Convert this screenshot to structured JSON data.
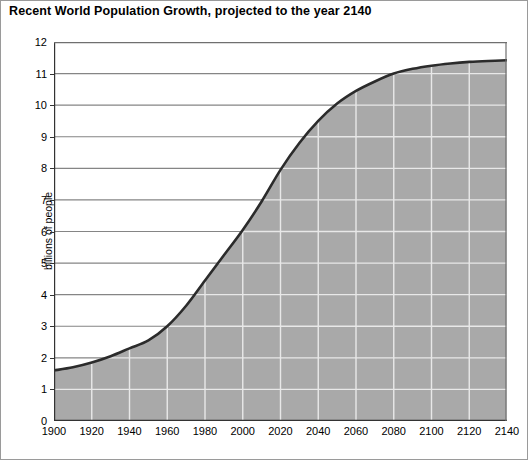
{
  "chart_data": {
    "type": "area",
    "title": "Recent World Population Growth, projected to the year 2140",
    "xlabel": "",
    "ylabel": "billions of people",
    "xlim": [
      1900,
      2140
    ],
    "ylim": [
      0,
      12
    ],
    "grid": true,
    "legend": "none",
    "xticks": [
      1900,
      1920,
      1940,
      1960,
      1980,
      2000,
      2020,
      2040,
      2060,
      2080,
      2100,
      2120,
      2140
    ],
    "yticks": [
      0,
      1,
      2,
      3,
      4,
      5,
      6,
      7,
      8,
      9,
      10,
      11,
      12
    ],
    "x": [
      1900,
      1910,
      1920,
      1930,
      1940,
      1950,
      1960,
      1970,
      1980,
      1990,
      2000,
      2010,
      2020,
      2030,
      2040,
      2050,
      2060,
      2070,
      2080,
      2090,
      2100,
      2110,
      2120,
      2130,
      2140
    ],
    "values": [
      1.6,
      1.7,
      1.85,
      2.05,
      2.3,
      2.55,
      3.0,
      3.65,
      4.45,
      5.25,
      6.05,
      6.95,
      7.95,
      8.8,
      9.5,
      10.05,
      10.45,
      10.75,
      11.0,
      11.15,
      11.25,
      11.32,
      11.37,
      11.4,
      11.42
    ],
    "series": [
      {
        "name": "World population",
        "values": [
          1.6,
          1.7,
          1.85,
          2.05,
          2.3,
          2.55,
          3.0,
          3.65,
          4.45,
          5.25,
          6.05,
          6.95,
          7.95,
          8.8,
          9.5,
          10.05,
          10.45,
          10.75,
          11.0,
          11.15,
          11.25,
          11.32,
          11.37,
          11.4,
          11.42
        ]
      }
    ],
    "colors": {
      "fill": "#a9a9a9",
      "line": "#2b2b2b",
      "grid_in_fill": "#e8e8e8",
      "grid_in_blank": "#858585",
      "axis": "#333333",
      "frame": "#9a9a9a"
    }
  }
}
